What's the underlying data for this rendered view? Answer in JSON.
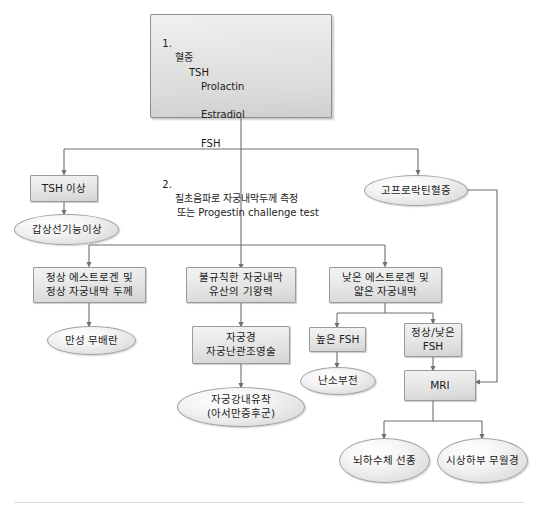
{
  "diagram": {
    "language": "ko",
    "colors": {
      "node_border": "#9a9a9a",
      "node_fill_top": "#f3f3f3",
      "node_fill_bottom": "#d2d2d2",
      "line": "#6f6f6f",
      "text": "#1c1c1c",
      "divider": "#d9d9d9",
      "background": "#ffffff"
    }
  },
  "nodes": {
    "initial_workup": {
      "shape": "rect",
      "item1_label": "혈중",
      "item1_tests": [
        "TSH",
        "Prolactin",
        "Estradiol",
        "FSH"
      ],
      "item2_label": "질초음파로 자궁내막두께 측정",
      "item2_alt": "또는 Progestin challenge test"
    },
    "tsh_abnormal": {
      "shape": "rect",
      "label": "TSH 이상"
    },
    "thyroid_dysfunction": {
      "shape": "ellipse",
      "label": "갑상선기능이상"
    },
    "hyperprolactinemia": {
      "shape": "ellipse",
      "label": "고프로락틴혈증"
    },
    "normal_estrogen": {
      "shape": "rect",
      "label": "정상 에스트로겐 및\n정상 자궁내막 두께"
    },
    "irregular_endometrium": {
      "shape": "rect",
      "label": "불규칙한 자궁내막\n유산의 기왕력"
    },
    "low_estrogen": {
      "shape": "rect",
      "label": "낮은 에스트로겐 및\n얇은 자궁내막"
    },
    "chronic_anovulation": {
      "shape": "ellipse",
      "label": "만성 무배란"
    },
    "hysteroscopy_hsg": {
      "shape": "rect",
      "label": "자궁경\n자궁난관조영술"
    },
    "asherman": {
      "shape": "ellipse",
      "label": "자궁강내유착\n(아서만증후군)"
    },
    "high_fsh": {
      "shape": "rect",
      "label": "높은 FSH"
    },
    "normal_low_fsh": {
      "shape": "rect",
      "label": "정상/낮은\nFSH"
    },
    "ovarian_failure": {
      "shape": "ellipse",
      "label": "난소부전"
    },
    "mri": {
      "shape": "rect",
      "label": "MRI"
    },
    "pituitary_adenoma": {
      "shape": "ellipse",
      "label": "뇌하수체 선종"
    },
    "hypothalamic_amenorrhea": {
      "shape": "ellipse",
      "label": "시상하부 무월경"
    }
  },
  "edges": [
    {
      "from": "initial_workup",
      "to": "tsh_abnormal"
    },
    {
      "from": "initial_workup",
      "to": "hyperprolactinemia"
    },
    {
      "from": "initial_workup",
      "to": "normal_estrogen"
    },
    {
      "from": "initial_workup",
      "to": "irregular_endometrium"
    },
    {
      "from": "initial_workup",
      "to": "low_estrogen"
    },
    {
      "from": "tsh_abnormal",
      "to": "thyroid_dysfunction"
    },
    {
      "from": "normal_estrogen",
      "to": "chronic_anovulation"
    },
    {
      "from": "irregular_endometrium",
      "to": "hysteroscopy_hsg"
    },
    {
      "from": "hysteroscopy_hsg",
      "to": "asherman"
    },
    {
      "from": "low_estrogen",
      "to": "high_fsh"
    },
    {
      "from": "low_estrogen",
      "to": "normal_low_fsh"
    },
    {
      "from": "high_fsh",
      "to": "ovarian_failure"
    },
    {
      "from": "normal_low_fsh",
      "to": "mri"
    },
    {
      "from": "hyperprolactinemia",
      "to": "mri"
    },
    {
      "from": "mri",
      "to": "pituitary_adenoma"
    },
    {
      "from": "mri",
      "to": "hypothalamic_amenorrhea"
    }
  ]
}
